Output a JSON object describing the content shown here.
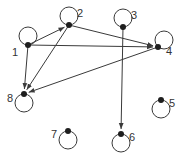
{
  "diagram": {
    "type": "directed-graph-with-self-loops",
    "colors": {
      "stroke": "#3a3a3a",
      "node": "#1e1e1e",
      "label": "#333333",
      "background": "#ffffff"
    },
    "nodes": [
      {
        "id": "1",
        "label": "1",
        "x": 28,
        "y": 45,
        "loop": "up",
        "lx": 12,
        "ly": 56
      },
      {
        "id": "2",
        "label": "2",
        "x": 69,
        "y": 25,
        "loop": "up",
        "lx": 77,
        "ly": 17
      },
      {
        "id": "3",
        "label": "3",
        "x": 123,
        "y": 27,
        "loop": "up",
        "lx": 131,
        "ly": 19
      },
      {
        "id": "4",
        "label": "4",
        "x": 158,
        "y": 47,
        "loop": "up-right",
        "lx": 166,
        "ly": 55
      },
      {
        "id": "5",
        "label": "5",
        "x": 161,
        "y": 100,
        "loop": "down",
        "lx": 169,
        "ly": 107
      },
      {
        "id": "6",
        "label": "6",
        "x": 121,
        "y": 134,
        "loop": "down",
        "lx": 129,
        "ly": 141
      },
      {
        "id": "7",
        "label": "7",
        "x": 68,
        "y": 131,
        "loop": "down",
        "lx": 51,
        "ly": 138
      },
      {
        "id": "8",
        "label": "8",
        "x": 24,
        "y": 94,
        "loop": "down",
        "lx": 7,
        "ly": 102
      }
    ],
    "edges": [
      {
        "from": "1",
        "to": "2"
      },
      {
        "from": "1",
        "to": "4"
      },
      {
        "from": "1",
        "to": "8"
      },
      {
        "from": "2",
        "to": "4"
      },
      {
        "from": "2",
        "to": "8"
      },
      {
        "from": "4",
        "to": "8"
      },
      {
        "from": "3",
        "to": "6"
      }
    ]
  }
}
